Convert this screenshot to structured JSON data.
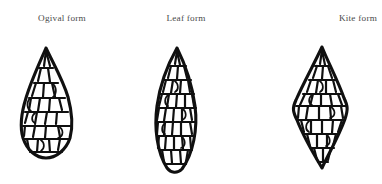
{
  "figure": {
    "background_color": "#ffffff",
    "ink_color": "#101010",
    "label_color": "#4a4a4a",
    "caption_style": "serif"
  },
  "panels": [
    {
      "id": "ogival",
      "label": "Ogival form",
      "shape": "teardrop-pointed-oval",
      "icon_name": "ogival-biface-icon",
      "bbox": {
        "x": 21,
        "y": 48,
        "width": 51,
        "height": 98
      }
    },
    {
      "id": "leaf",
      "label": "Leaf form",
      "shape": "lenticular-lanceolate",
      "icon_name": "leaf-biface-icon",
      "bbox": {
        "x": 165,
        "y": 48,
        "width": 50,
        "height": 122
      }
    },
    {
      "id": "kite",
      "label": "Kite form",
      "shape": "rhombic-diamond",
      "icon_name": "kite-biface-icon",
      "bbox": {
        "x": 293,
        "y": 47,
        "width": 59,
        "height": 121
      }
    }
  ]
}
